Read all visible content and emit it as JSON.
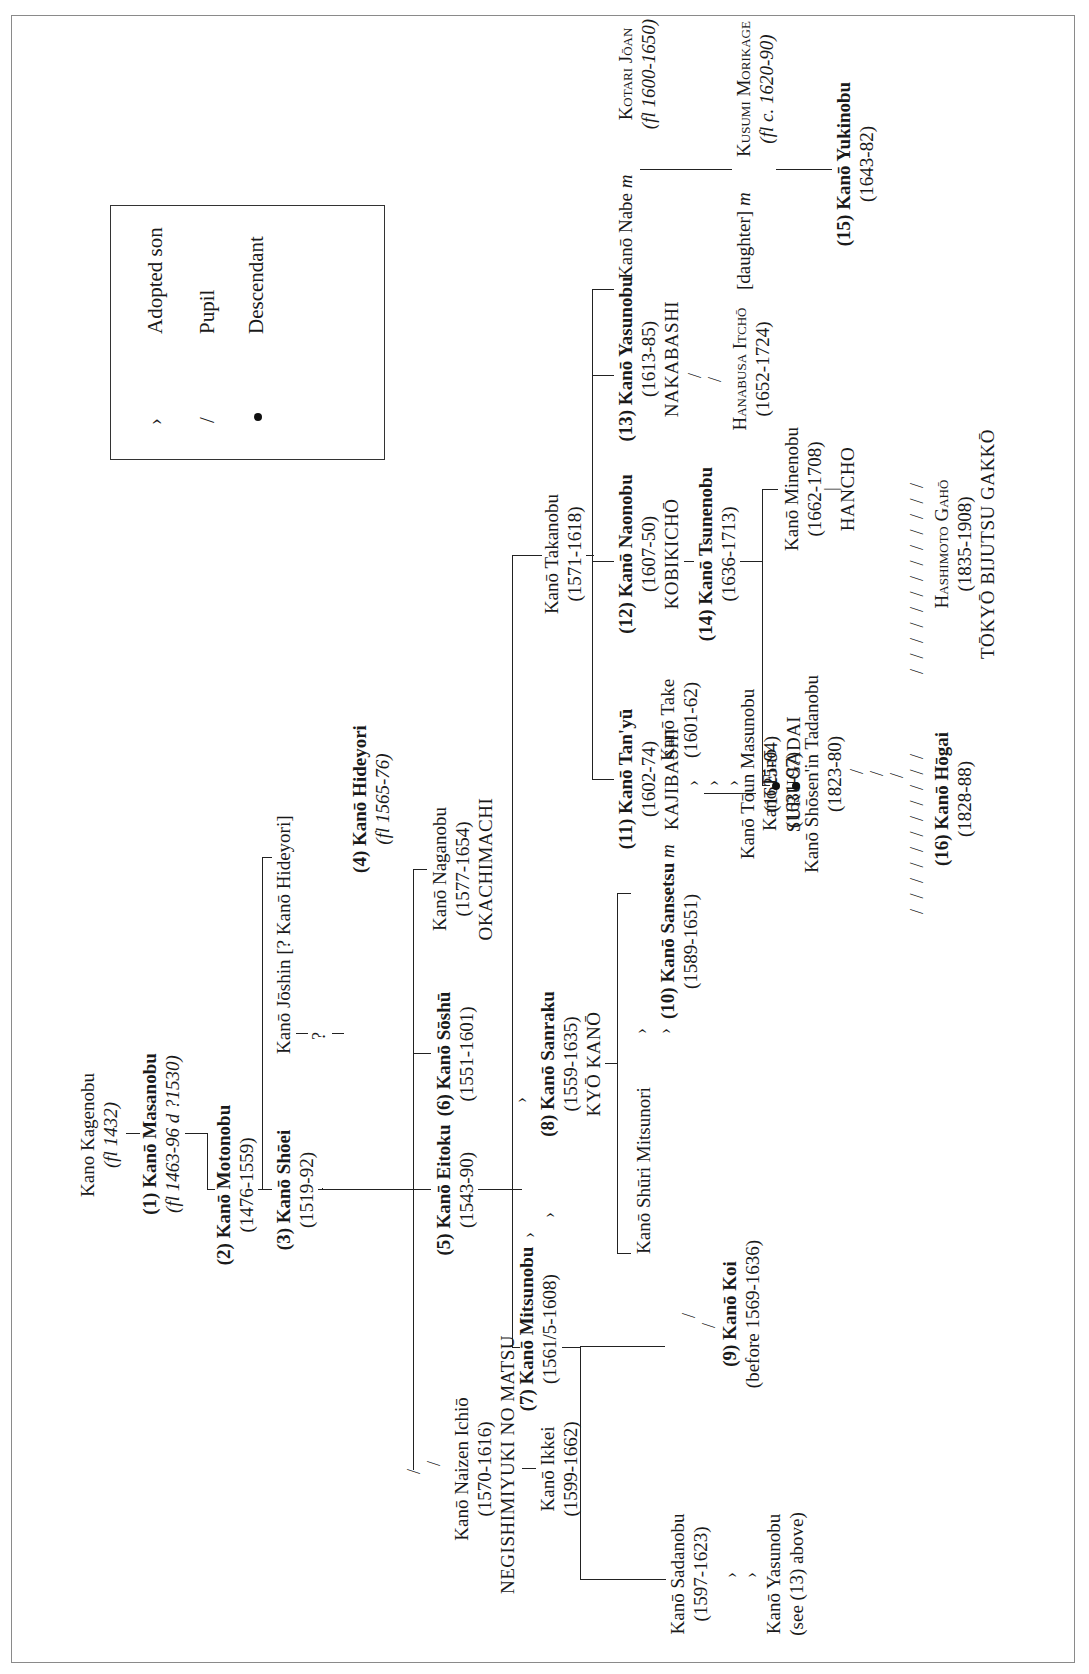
{
  "legend": {
    "items": [
      {
        "symbol": "adopted-symbol",
        "glyph": "›",
        "label": "Adopted son"
      },
      {
        "symbol": "pupil-symbol",
        "glyph": "/",
        "label": "Pupil"
      },
      {
        "symbol": "descendant-symbol",
        "glyph": "•",
        "label": "Descendant"
      }
    ]
  },
  "nodes": {
    "kagenobu": {
      "name": "Kano Kagenobu",
      "dates": "(fl 1432)"
    },
    "masanobu": {
      "name": "(1) Kanō Masanobu",
      "dates": "(fl 1463-96 d ?1530)"
    },
    "motonobu": {
      "name": "(2) Kanō Motonobu",
      "dates": "(1476-1559)"
    },
    "shoei": {
      "name": "(3) Kanō Shōei",
      "dates": "(1519-92)"
    },
    "joshin": {
      "name": "Kanō Jōshin [? Kanō Hideyori]",
      "mark": "?"
    },
    "hideyori": {
      "name": "(4) Kanō Hideyori",
      "dates": "(fl 1565-76)"
    },
    "eitoku": {
      "name": "(5) Kanō Eitoku",
      "dates": "(1543-90)"
    },
    "soshu": {
      "name": "(6) Kanō Sōshū",
      "dates": "(1551-1601)"
    },
    "naganobu": {
      "name": "Kanō Naganobu",
      "dates": "(1577-1654)",
      "school": "OKACHIMACHI"
    },
    "ichio": {
      "name": "Kanō Naizen Ichiō",
      "dates": "(1570-1616)",
      "school": "NEGISHIMIYUKI NO MATSU"
    },
    "ikkei": {
      "name": "Kanō Ikkei",
      "dates": "(1599-1662)"
    },
    "mitsunobu": {
      "name": "(7) Kanō Mitsunobu",
      "dates": "(1561/5-1608)"
    },
    "sanraku": {
      "name": "(8) Kanō Sanraku",
      "dates": "(1559-1635)",
      "school": "KYŌ KANŌ"
    },
    "koi": {
      "name": "(9) Kanō Koi",
      "dates": "(before 1569-1636)"
    },
    "sadanobu": {
      "name": "Kanō Sadanobu",
      "dates": "(1597-1623)"
    },
    "yasunobu_ref": {
      "name": "Kanō Yasunobu",
      "dates": "(see (13) above)"
    },
    "mitsunori": {
      "name": "Kanō Shūri Mitsunori"
    },
    "sansetsu": {
      "name": "(10) Kanō Sansetsu",
      "marriage": "m",
      "dates": "(1589-1651)"
    },
    "take": {
      "name": "Kanō Take",
      "dates": "(1601-62)"
    },
    "eino": {
      "name": "Kanō Einō",
      "dates": "(1631-97)"
    },
    "takanobu": {
      "name": "Kanō Takanobu",
      "dates": "(1571-1618)"
    },
    "tanyu": {
      "name": "(11) Kanō Tan'yū",
      "dates": "(1602-74)",
      "school": "KAJIBASHI"
    },
    "masunobu": {
      "name": "Kanō Tōun Masunobu",
      "dates": "(1625-94)",
      "school": "SURUGADAI"
    },
    "naonobu": {
      "name": "(12) Kanō Naonobu",
      "dates": "(1607-50)",
      "school": "KOBIKICHŌ"
    },
    "tsunenobu": {
      "name": "(14) Kanō Tsunenobu",
      "dates": "(1636-1713)"
    },
    "yasunobu": {
      "name": "(13) Kanō Yasunobu",
      "dates": "(1613-85)",
      "school": "NAKABASHI"
    },
    "itcho": {
      "name": "Hanabusa Itchō",
      "dates": "(1652-1724)"
    },
    "minenobu": {
      "name": "Kanō Minenobu",
      "dates": "(1662-1708)",
      "school": "HANCHO"
    },
    "tadanobu": {
      "name": "Kanō Shōsen'in Tadanobu",
      "dates": "(1823-80)"
    },
    "hogai": {
      "name": "(16) Kanō Hōgai",
      "dates": "(1828-88)"
    },
    "gaho": {
      "name": "Hashimoto Gahō",
      "dates": "(1835-1908)",
      "school": "TŌKYŌ BIJUTSU GAKKŌ"
    },
    "nabe": {
      "name": "Kanō Nabe",
      "marriage": "m"
    },
    "joan": {
      "name": "Kotari Jōan",
      "dates": "(fl 1600-1650)"
    },
    "daughter": {
      "name": "[daughter]",
      "marriage": "m"
    },
    "morikage": {
      "name": "Kusumi Morikage",
      "dates": "(fl c. 1620-90)"
    },
    "yukinobu": {
      "name": "(15) Kanō Yukinobu",
      "dates": "(1643-82)"
    }
  }
}
